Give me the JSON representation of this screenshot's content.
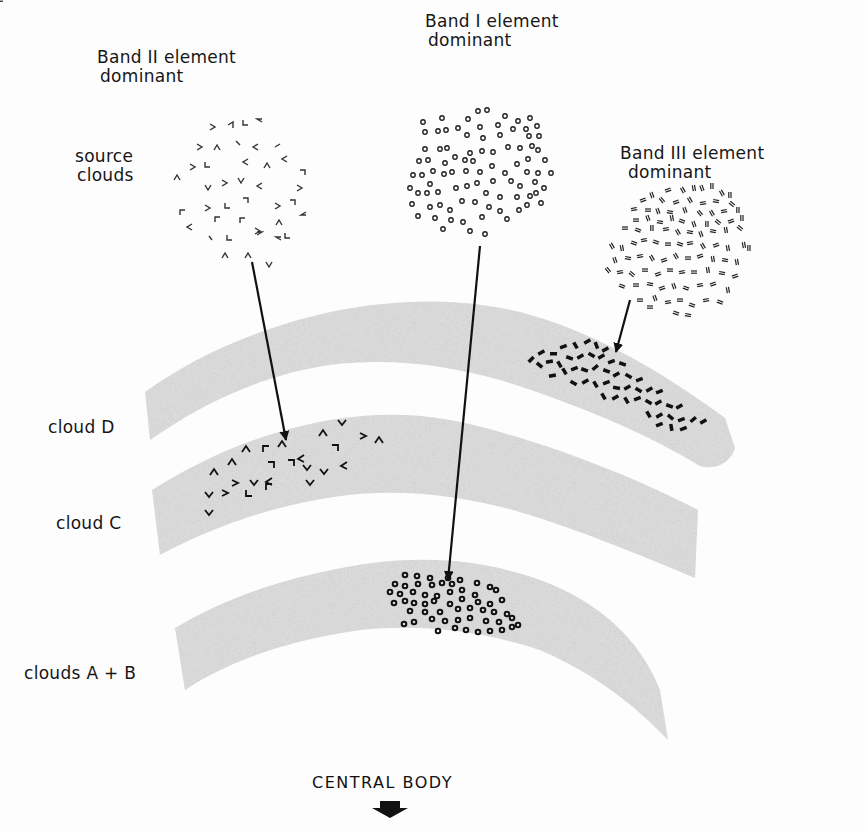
{
  "diagram": {
    "source_label": {
      "line1": "source",
      "line2": "clouds"
    },
    "sources": [
      {
        "id": "band2",
        "title_line1": "Band II element",
        "title_line2": "dominant",
        "marker": "chevron",
        "target": "cloud C"
      },
      {
        "id": "band1",
        "title_line1": "Band I element",
        "title_line2": "dominant",
        "marker": "ring",
        "target": "clouds A+B"
      },
      {
        "id": "band3",
        "title_line1": "Band III element",
        "title_line2": "dominant",
        "marker": "double-dash",
        "target": "cloud D"
      }
    ],
    "clouds": [
      {
        "id": "cloud-d",
        "label": "cloud D",
        "fill": "#d8d8d8"
      },
      {
        "id": "cloud-c",
        "label": "cloud C",
        "fill": "#d8d8d8"
      },
      {
        "id": "clouds-ab",
        "label": "clouds A + B",
        "fill": "#d8d8d8"
      }
    ],
    "central_body": {
      "label": "CENTRAL BODY",
      "icon": "down-arrow-icon"
    }
  }
}
